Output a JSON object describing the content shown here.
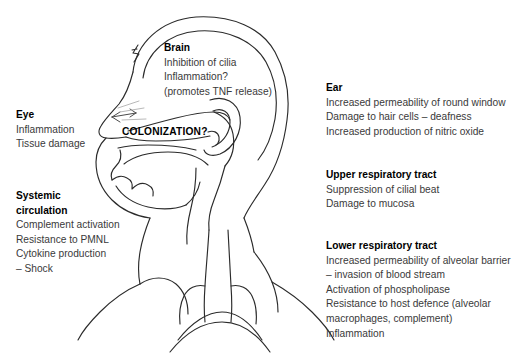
{
  "diagram": {
    "figure_name": "head-and-upper-body-profile",
    "stroke_color": "#2b2b2b",
    "background_color": "#ffffff",
    "text_color": "#3a3a3a",
    "heading_color": "#000000"
  },
  "overlay": {
    "colonization_label": "COLONIZATION?"
  },
  "blocks": {
    "brain": {
      "title": "Brain",
      "lines": [
        "Inhibition of cilia",
        "Inflammation?",
        "(promotes TNF release)"
      ]
    },
    "eye": {
      "title": "Eye",
      "lines": [
        "Inflammation",
        "Tissue damage"
      ]
    },
    "ear": {
      "title": "Ear",
      "lines": [
        "Increased permeability of round window",
        "Damage to hair cells – deafness",
        "Increased production of nitric oxide"
      ]
    },
    "systemic_circulation": {
      "title": "Systemic",
      "title2": "circulation",
      "lines": [
        "Complement activation",
        "Resistance to PMNL",
        "Cytokine production",
        "– Shock"
      ]
    },
    "upper_respiratory_tract": {
      "title": "Upper respiratory tract",
      "lines": [
        "Suppression of cilial beat",
        "Damage to mucosa"
      ]
    },
    "lower_respiratory_tract": {
      "title": "Lower respiratory tract",
      "lines": [
        "Increased permeability of alveolar barrier",
        "– invasion of blood stream",
        "Activation of phospholipase",
        "Resistance to host defence (alveolar",
        "macrophages, complement)",
        "Inflammation"
      ]
    }
  }
}
